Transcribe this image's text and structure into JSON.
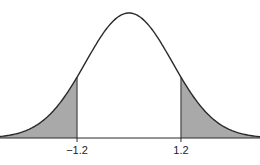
{
  "chart_data": {
    "type": "area",
    "title": "",
    "distribution": "normal",
    "mean": 0,
    "sd": 1,
    "xlim": [
      -3.3,
      3.3
    ],
    "shaded_regions": [
      {
        "name": "left-tail",
        "from": -3.3,
        "to": -1.2
      },
      {
        "name": "right-tail",
        "from": 1.2,
        "to": 3.3
      }
    ],
    "critical_values": [
      -1.2,
      1.2
    ],
    "tick_labels": [
      "−1.2",
      "1.2"
    ],
    "xlabel": "",
    "ylabel": "",
    "grid": false,
    "colors": {
      "curve": "#2a2a2a",
      "shade": "#a9a9a9"
    }
  }
}
